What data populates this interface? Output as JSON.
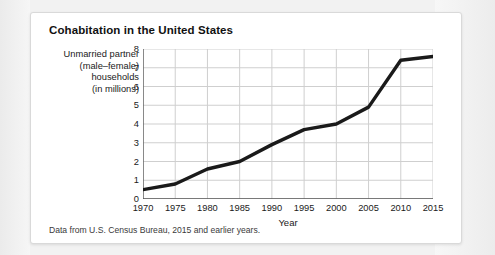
{
  "card": {
    "title": "Cohabitation in the United States",
    "caption": "Data from U.S. Census Bureau, 2015 and earlier years."
  },
  "axis_caption": {
    "line1": "Unmarried partner",
    "line2": "(male–female)",
    "line3": "households",
    "line4": "(in millions)"
  },
  "colors": {
    "line": "#1a1a1a",
    "grid": "#cfcfcf",
    "axis": "#555555",
    "card_bg": "#ffffff",
    "page_bg": "#f2f2f2"
  },
  "chart_data": {
    "type": "line",
    "title": "Cohabitation in the United States",
    "xlabel": "Year",
    "ylabel": "Unmarried partner (male–female) households (in millions)",
    "x": [
      1970,
      1975,
      1980,
      1985,
      1990,
      1995,
      2000,
      2005,
      2010,
      2015
    ],
    "values": [
      0.5,
      0.8,
      1.6,
      2.0,
      2.9,
      3.7,
      4.0,
      4.9,
      7.4,
      7.6
    ],
    "xlim": [
      1970,
      2015
    ],
    "ylim": [
      0,
      8
    ],
    "xticks": [
      1970,
      1975,
      1980,
      1985,
      1990,
      1995,
      2000,
      2005,
      2010,
      2015
    ],
    "yticks": [
      0,
      1,
      2,
      3,
      4,
      5,
      6,
      7,
      8
    ],
    "xtick_labels": [
      "1970",
      "1975",
      "1980",
      "1985",
      "1990",
      "1995",
      "2000",
      "2005",
      "2010",
      "2015"
    ],
    "ytick_labels": [
      "0",
      "1",
      "2",
      "3",
      "4",
      "5",
      "6",
      "7",
      "8"
    ],
    "grid": true,
    "legend": null,
    "series_color": "#1a1a1a",
    "line_width": 3.4
  }
}
